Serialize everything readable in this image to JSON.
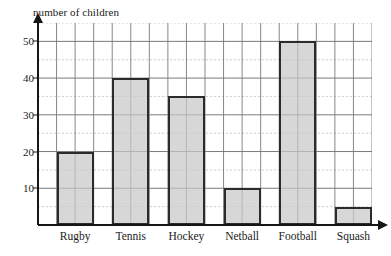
{
  "chart_data": {
    "type": "bar",
    "title": "",
    "subtitle": "",
    "xlabel": "",
    "ylabel": "number of children",
    "categories": [
      "Rugby",
      "Tennis",
      "Hockey",
      "Netball",
      "Football",
      "Squash"
    ],
    "values": [
      20,
      40,
      35,
      10,
      50,
      5
    ],
    "series": [
      {
        "name": "number of children",
        "values": [
          20,
          40,
          35,
          10,
          50,
          5
        ]
      }
    ],
    "ylim": [
      0,
      55
    ],
    "y_major_ticks": [
      10,
      20,
      30,
      40,
      50
    ],
    "y_major_tick_labels": [
      "10",
      "20",
      "30",
      "40",
      "50"
    ],
    "y_minor_tick_step": 5,
    "grid": true,
    "grid_major_color": "#7a7a7a",
    "grid_minor_color": "#b9b9b9",
    "legend": false,
    "legend_position": "none",
    "annotations": [],
    "bar_fill_color": "#c8c8c8",
    "bar_border_color": "#2b2b2b",
    "axis_color": "#161616",
    "background_color": "#ffffff"
  },
  "axis": {
    "y_title": "number of children",
    "y_arrow_icon": "arrow-up-icon",
    "x_arrow_icon": "arrow-right-icon"
  }
}
